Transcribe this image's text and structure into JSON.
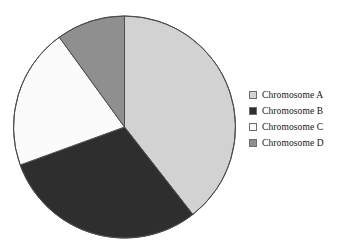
{
  "chart_data": {
    "type": "pie",
    "title": "",
    "subtitle": "",
    "xlabel": "",
    "ylabel": "",
    "grid": false,
    "legend_position": "right",
    "start_angle_deg": 0,
    "direction": "clockwise",
    "categories": [
      "Chromosome A",
      "Chromosome B",
      "Chromosome C",
      "Chromosome D"
    ],
    "values": [
      39.4,
      30.0,
      20.6,
      10.0
    ],
    "value_unit": "percent",
    "angles_deg": [
      142,
      108,
      74,
      36
    ],
    "colors": [
      "#d2d2d2",
      "#2e2e2e",
      "#fbfbfb",
      "#8f8f8f"
    ],
    "slice_border_color": "#4d4d4d",
    "slices": [
      {
        "label": "Chromosome A",
        "value": 39.4,
        "angle_deg": 142,
        "color": "#d2d2d2",
        "swatch": "light-gray"
      },
      {
        "label": "Chromosome B",
        "value": 30.0,
        "angle_deg": 108,
        "color": "#2e2e2e",
        "swatch": "dark-gray"
      },
      {
        "label": "Chromosome C",
        "value": 20.6,
        "angle_deg": 74,
        "color": "#fbfbfb",
        "swatch": "white"
      },
      {
        "label": "Chromosome D",
        "value": 10.0,
        "angle_deg": 36,
        "color": "#8f8f8f",
        "swatch": "medium-gray"
      }
    ],
    "geometry": {
      "center_x": 112.5,
      "center_y": 113,
      "radius": 111
    }
  },
  "legend": {
    "items": [
      {
        "label": "Chromosome A",
        "color": "#d2d2d2"
      },
      {
        "label": "Chromosome B",
        "color": "#2e2e2e"
      },
      {
        "label": "Chromosome C",
        "color": "#fbfbfb"
      },
      {
        "label": "Chromosome D",
        "color": "#8f8f8f"
      }
    ]
  }
}
